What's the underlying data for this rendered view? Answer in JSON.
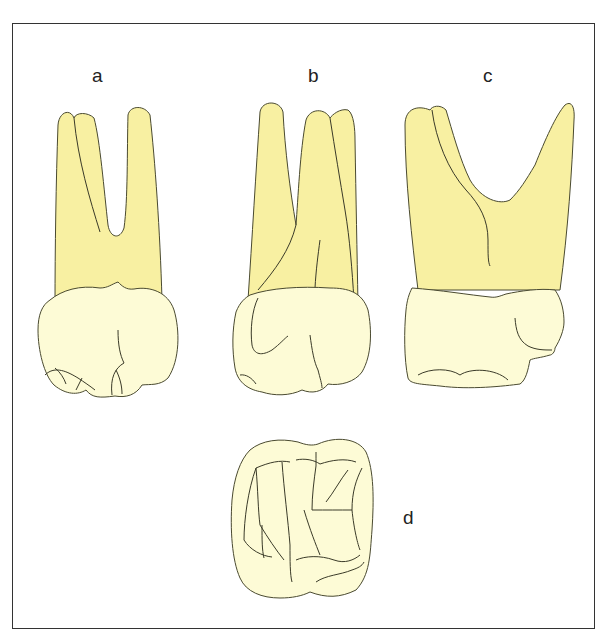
{
  "figure": {
    "labels": {
      "a": "a",
      "b": "b",
      "c": "c",
      "d": "d"
    },
    "colors": {
      "root": "#f8f0a2",
      "crown": "#fdfbd6",
      "outline": "#4a4a30",
      "frame": "#333333"
    },
    "views": [
      {
        "id": "a",
        "label": "a"
      },
      {
        "id": "b",
        "label": "b"
      },
      {
        "id": "c",
        "label": "c"
      },
      {
        "id": "d",
        "label": "d"
      }
    ]
  }
}
